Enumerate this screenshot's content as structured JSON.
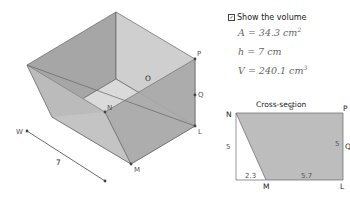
{
  "controls": {
    "show_volume_label": "Show the volume",
    "show_volume_checked": true
  },
  "formulas": {
    "area": "A = 34.3 cm",
    "area_exp": "2",
    "height": "h = 7 cm",
    "volume": "V = 240.1 cm",
    "volume_exp": "3"
  },
  "solid": {
    "points": {
      "P": "P",
      "Q": "Q",
      "L": "L",
      "M": "M",
      "N": "N",
      "O": "O",
      "W": "W"
    },
    "length_label": "7"
  },
  "cross_section": {
    "title": "Cross-section",
    "vertices": {
      "N": "N",
      "P": "P",
      "Q": "Q",
      "M": "M",
      "L": "L"
    },
    "dims": {
      "top": "8",
      "left": "5",
      "right": "5",
      "bottom_left": "2.3",
      "bottom_right": "5.7"
    }
  },
  "colors": {
    "face_dark": "#a9a9a9",
    "face_mid": "#bdbdbd",
    "face_light": "#d6d6d6",
    "edge": "#555555"
  }
}
